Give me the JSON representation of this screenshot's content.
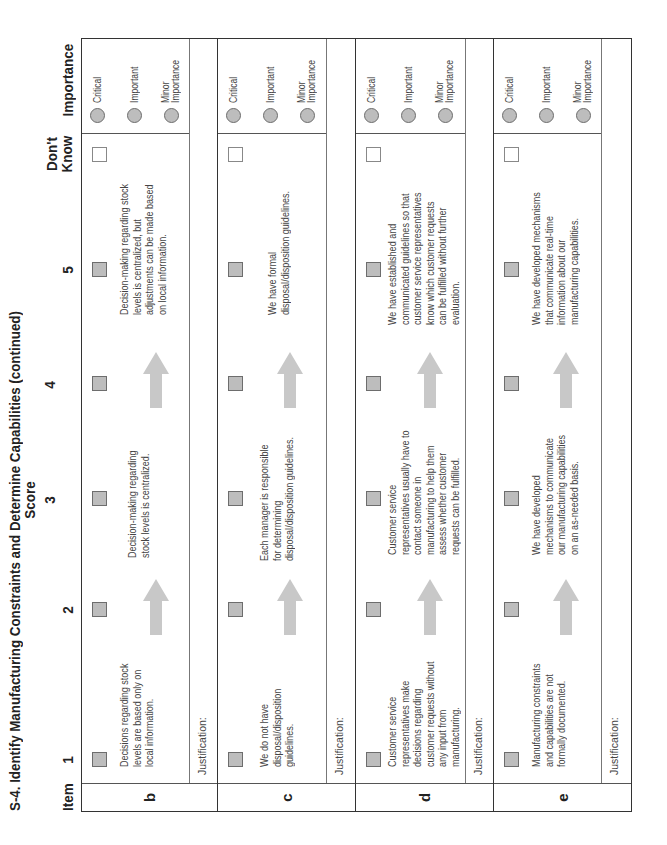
{
  "title": "S-4. Identify Manufacturing Constraints and Determine Capabilities (continued)",
  "header": {
    "item": "Item",
    "score": "Score",
    "score_columns": [
      "1",
      "2",
      "3",
      "4",
      "5"
    ],
    "dont_know_line1": "Don't",
    "dont_know_line2": "Know",
    "importance": "Importance"
  },
  "importance_options": [
    "Critical",
    "Important",
    "Minor Importance"
  ],
  "importance_minor_line1": "Minor",
  "importance_minor_line2": "Importance",
  "justification_label": "Justification:",
  "colors": {
    "checkbox_fill": "#bdbdbd",
    "arrow_fill": "#c8c8c8",
    "border": "#333333"
  },
  "rows": [
    {
      "item": "b",
      "low": "Decisions regarding stock levels are based only on local information.",
      "mid": "Decision-making regarding stock levels is centralized.",
      "high": "Decision-making regarding stock levels is centralized, but adjustments can be made based on local information.",
      "low_lines": [
        "Decisions regarding stock",
        "levels are based only on",
        "local information."
      ],
      "mid_lines": [
        "Decision-making regarding",
        "stock levels is centralized."
      ],
      "high_lines": [
        "Decision-making regarding stock",
        "levels is centralized, but",
        "adjustments can be made based",
        "on local information."
      ]
    },
    {
      "item": "c",
      "low": "We do not have disposal/disposition guidelines.",
      "mid": "Each manager is responsible for determining disposal/disposition guidelines.",
      "high": "We have formal disposal/disposition guidelines.",
      "low_lines": [
        "We do not have",
        "disposal/disposition",
        "guidelines."
      ],
      "mid_lines": [
        "Each manager is responsible",
        "for determining",
        "disposal/disposition guidelines."
      ],
      "high_lines": [
        "We have formal",
        "disposal/disposition guidelines."
      ]
    },
    {
      "item": "d",
      "low": "Customer service representatives make decisions regarding customer requests without any input from manufacturing.",
      "mid": "Customer service representatives usually have to contact someone in manufacturing to help them assess whether customer requests can be fulfilled.",
      "high": "We have established and communicated guidelines so that customer service representatives know which customer requests can be fulfilled without further evaluation.",
      "low_lines": [
        "Customer service",
        "representatives make",
        "decisions regarding",
        "customer requests without",
        "any input from",
        "manufacturing."
      ],
      "mid_lines": [
        "Customer service",
        "representatives usually have to",
        "contact someone in",
        "manufacturing to help them",
        "assess whether customer",
        "requests can be fulfilled."
      ],
      "high_lines": [
        "We have established and",
        "communicated guidelines so that",
        "customer service representatives",
        "know which customer requests",
        "can be fulfilled without further",
        "evaluation."
      ]
    },
    {
      "item": "e",
      "low": "Manufacturing constraints and capabilities are not formally documented.",
      "mid": "We have developed mechanisms to communicate our manufacturing capabilities on an as-needed basis.",
      "high": "We have developed mechanisms that communicate real-time information about our manufacturing capabilities.",
      "low_lines": [
        "Manufacturing constraints",
        "and capabilities are not",
        "formally documented."
      ],
      "mid_lines": [
        "We have developed",
        "mechanisms to communicate",
        "our manufacturing capabilities",
        "on an as-needed basis."
      ],
      "high_lines": [
        "We have developed mechanisms",
        "that communicate real-time",
        "information about our",
        "manufacturing capabilities."
      ]
    }
  ]
}
